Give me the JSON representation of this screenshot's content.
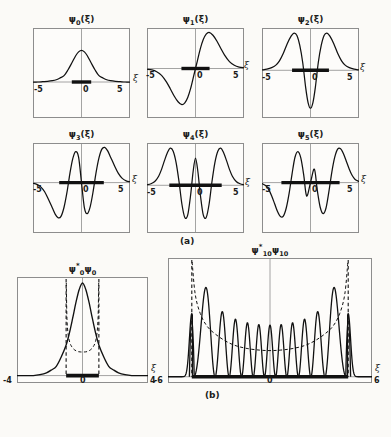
{
  "figure": {
    "background": "#fbfaf7",
    "ink": "#111111",
    "frame_color": "#8d8d8d",
    "section_a_label": "(a)",
    "section_b_label": "(b)",
    "axis_symbol": "ξ"
  },
  "chart_data": {
    "type": "line",
    "xlabel": "ξ",
    "ylabel": "",
    "grid": false,
    "legend": "none",
    "panels": [
      {
        "id": "psi0",
        "title_psi": "ψ",
        "title_sub": "0",
        "title_arg": "(ξ)",
        "title_full": "ψ0(ξ)",
        "section": "a",
        "xlim": [
          -5,
          5
        ],
        "xticks": [
          -5,
          0,
          5
        ],
        "xticklabels": [
          "-5",
          "0",
          "5"
        ],
        "nodes": 0,
        "parity": "even",
        "turning_bar": [
          -1.0,
          1.0
        ],
        "zero_line_frac": 0.6,
        "x": [
          -5,
          -4.5,
          -4,
          -3.5,
          -3,
          -2.6,
          -2.2,
          -1.8,
          -1.4,
          -1,
          -0.6,
          -0.3,
          0,
          0.3,
          0.6,
          1,
          1.4,
          1.8,
          2.2,
          2.6,
          3,
          3.5,
          4,
          4.5,
          5
        ],
        "y": [
          0.0,
          0.0,
          0.01,
          0.02,
          0.04,
          0.07,
          0.13,
          0.2,
          0.38,
          0.6,
          0.83,
          0.95,
          1.0,
          0.95,
          0.83,
          0.6,
          0.38,
          0.2,
          0.13,
          0.07,
          0.04,
          0.02,
          0.01,
          0.0,
          0.0
        ]
      },
      {
        "id": "psi1",
        "title_psi": "ψ",
        "title_sub": "1",
        "title_arg": "(ξ)",
        "title_full": "ψ1(ξ)",
        "section": "a",
        "xlim": [
          -5,
          5
        ],
        "xticks": [
          -5,
          0,
          5
        ],
        "xticklabels": [
          "-5",
          "0",
          "5"
        ],
        "nodes": 1,
        "parity": "odd",
        "turning_bar": [
          -1.45,
          1.45
        ],
        "zero_line_frac": 0.45,
        "x": [
          -5,
          -4.5,
          -4,
          -3.5,
          -3,
          -2.6,
          -2.2,
          -1.8,
          -1.4,
          -1.1,
          -0.8,
          -0.5,
          -0.2,
          0,
          0.2,
          0.5,
          0.8,
          1.1,
          1.4,
          1.8,
          2.2,
          2.6,
          3,
          3.5,
          4,
          4.5,
          5
        ],
        "y": [
          -0.02,
          -0.04,
          -0.09,
          -0.19,
          -0.37,
          -0.56,
          -0.76,
          -0.92,
          -1.0,
          -0.95,
          -0.8,
          -0.55,
          -0.22,
          0.0,
          0.22,
          0.55,
          0.8,
          0.95,
          1.0,
          0.92,
          0.76,
          0.56,
          0.37,
          0.19,
          0.09,
          0.04,
          0.02
        ]
      },
      {
        "id": "psi2",
        "title_psi": "ψ",
        "title_sub": "2",
        "title_arg": "(ξ)",
        "title_full": "ψ2(ξ)",
        "section": "a",
        "xlim": [
          -5,
          5
        ],
        "xticks": [
          -5,
          0,
          5
        ],
        "xticklabels": [
          "-5",
          "0",
          "5"
        ],
        "nodes": 2,
        "parity": "even",
        "turning_bar": [
          -1.9,
          1.9
        ],
        "zero_line_frac": 0.47,
        "x": [
          -5,
          -4.5,
          -4,
          -3.6,
          -3.2,
          -2.8,
          -2.4,
          -2.0,
          -1.7,
          -1.4,
          -1.1,
          -0.8,
          -0.5,
          -0.25,
          0,
          0.25,
          0.5,
          0.8,
          1.1,
          1.4,
          1.7,
          2.0,
          2.4,
          2.8,
          3.2,
          3.6,
          4,
          4.5,
          5
        ],
        "y": [
          0.01,
          0.03,
          0.07,
          0.13,
          0.25,
          0.45,
          0.7,
          0.9,
          0.98,
          0.92,
          0.65,
          0.2,
          -0.45,
          -0.85,
          -1.0,
          -0.85,
          -0.45,
          0.2,
          0.65,
          0.92,
          0.98,
          0.9,
          0.7,
          0.45,
          0.25,
          0.13,
          0.07,
          0.03,
          0.01
        ]
      },
      {
        "id": "psi3",
        "title_psi": "ψ",
        "title_sub": "3",
        "title_arg": "(ξ)",
        "title_full": "ψ3(ξ)",
        "section": "a",
        "xlim": [
          -5,
          5
        ],
        "xticks": [
          -5,
          0,
          5
        ],
        "xticklabels": [
          "-5",
          "0",
          "5"
        ],
        "nodes": 3,
        "parity": "odd",
        "turning_bar": [
          -2.3,
          2.3
        ],
        "zero_line_frac": 0.44,
        "x": [
          -5,
          -4.6,
          -4.2,
          -3.8,
          -3.4,
          -3.0,
          -2.7,
          -2.4,
          -2.1,
          -1.8,
          -1.5,
          -1.2,
          -0.9,
          -0.6,
          -0.3,
          0,
          0.3,
          0.6,
          0.9,
          1.2,
          1.5,
          1.8,
          2.1,
          2.4,
          2.7,
          3.0,
          3.4,
          3.8,
          4.2,
          4.6,
          5
        ],
        "y": [
          -0.02,
          -0.05,
          -0.12,
          -0.26,
          -0.48,
          -0.72,
          -0.9,
          -1.0,
          -0.95,
          -0.7,
          -0.28,
          0.25,
          0.68,
          0.88,
          0.72,
          0.0,
          -0.72,
          -0.88,
          -0.68,
          -0.25,
          0.28,
          0.7,
          0.95,
          1.0,
          0.9,
          0.72,
          0.48,
          0.26,
          0.12,
          0.05,
          0.02
        ]
      },
      {
        "id": "psi4",
        "title_psi": "ψ",
        "title_sub": "4",
        "title_arg": "(ξ)",
        "title_full": "ψ4(ξ)",
        "section": "a",
        "xlim": [
          -5,
          5
        ],
        "xticks": [
          -5,
          0,
          5
        ],
        "xticklabels": [
          "-5",
          "0",
          "5"
        ],
        "nodes": 4,
        "parity": "even",
        "turning_bar": [
          -2.7,
          2.7
        ],
        "zero_line_frac": 0.47,
        "x": [
          -5,
          -4.6,
          -4.2,
          -3.8,
          -3.5,
          -3.2,
          -2.9,
          -2.6,
          -2.3,
          -2.0,
          -1.7,
          -1.4,
          -1.1,
          -0.8,
          -0.5,
          -0.25,
          0,
          0.25,
          0.5,
          0.8,
          1.1,
          1.4,
          1.7,
          2.0,
          2.3,
          2.6,
          2.9,
          3.2,
          3.5,
          3.8,
          4.2,
          4.6,
          5
        ],
        "y": [
          0.01,
          0.04,
          0.1,
          0.24,
          0.42,
          0.65,
          0.86,
          0.98,
          0.9,
          0.6,
          0.1,
          -0.5,
          -0.85,
          -0.78,
          -0.25,
          0.35,
          0.72,
          0.35,
          -0.25,
          -0.78,
          -0.85,
          -0.5,
          0.1,
          0.6,
          0.9,
          0.98,
          0.86,
          0.65,
          0.42,
          0.24,
          0.1,
          0.04,
          0.01
        ]
      },
      {
        "id": "psi5",
        "title_psi": "ψ",
        "title_sub": "5",
        "title_arg": "(ξ)",
        "title_full": "ψ5(ξ)",
        "section": "a",
        "xlim": [
          -5,
          5
        ],
        "xticks": [
          -5,
          0,
          5
        ],
        "xticklabels": [
          "-5",
          "0",
          "5"
        ],
        "nodes": 5,
        "parity": "odd",
        "turning_bar": [
          -3.0,
          3.0
        ],
        "zero_line_frac": 0.44,
        "x": [
          -5,
          -4.6,
          -4.3,
          -4.0,
          -3.7,
          -3.4,
          -3.1,
          -2.8,
          -2.5,
          -2.2,
          -1.9,
          -1.6,
          -1.3,
          -1.0,
          -0.7,
          -0.4,
          0,
          0.4,
          0.7,
          1.0,
          1.3,
          1.6,
          1.9,
          2.2,
          2.5,
          2.8,
          3.1,
          3.4,
          3.7,
          4.0,
          4.3,
          4.6,
          5
        ],
        "y": [
          -0.03,
          -0.09,
          -0.2,
          -0.38,
          -0.6,
          -0.82,
          -0.96,
          -0.95,
          -0.72,
          -0.3,
          0.25,
          0.72,
          0.88,
          0.7,
          0.22,
          -0.38,
          0.0,
          0.38,
          -0.22,
          -0.7,
          -0.88,
          -0.72,
          -0.25,
          0.3,
          0.72,
          0.95,
          0.96,
          0.82,
          0.6,
          0.38,
          0.2,
          0.09,
          0.03
        ]
      },
      {
        "id": "prob0",
        "title_psi": "ψ",
        "title_sub": "0",
        "title_sup": "*",
        "title_second": "ψ",
        "title_second_sub": "0",
        "title_full": "ψ0*ψ0",
        "section": "b",
        "xlim": [
          -4,
          4
        ],
        "xticks": [
          -4,
          0,
          4
        ],
        "xticklabels": [
          "-4",
          "0",
          "4"
        ],
        "turning_bar": [
          -1.0,
          1.0
        ],
        "turning_lines": [
          -1.0,
          1.0
        ],
        "zero_line_frac": 0.93,
        "x": [
          -4,
          -3.5,
          -3,
          -2.6,
          -2.2,
          -1.9,
          -1.6,
          -1.3,
          -1.0,
          -0.8,
          -0.6,
          -0.4,
          -0.2,
          0,
          0.2,
          0.4,
          0.6,
          0.8,
          1.0,
          1.3,
          1.6,
          1.9,
          2.2,
          2.6,
          3,
          3.5,
          4
        ],
        "y": [
          0.0,
          0.0,
          0.0,
          0.01,
          0.03,
          0.06,
          0.1,
          0.2,
          0.33,
          0.46,
          0.62,
          0.79,
          0.93,
          1.0,
          0.93,
          0.79,
          0.62,
          0.46,
          0.33,
          0.2,
          0.1,
          0.06,
          0.03,
          0.01,
          0.0,
          0.0,
          0.0
        ],
        "classical_x": [
          -0.99,
          -0.95,
          -0.88,
          -0.78,
          -0.65,
          -0.5,
          -0.3,
          -0.1,
          0.1,
          0.3,
          0.5,
          0.65,
          0.78,
          0.88,
          0.95,
          0.99
        ],
        "classical_y": [
          1.0,
          0.62,
          0.45,
          0.36,
          0.31,
          0.28,
          0.26,
          0.255,
          0.255,
          0.26,
          0.28,
          0.31,
          0.36,
          0.45,
          0.62,
          1.0
        ]
      },
      {
        "id": "prob10",
        "title_psi": "ψ",
        "title_sub": "10",
        "title_sup": "*",
        "title_second": "ψ",
        "title_second_sub": "10",
        "title_full": "ψ10*ψ10",
        "section": "b",
        "xlim": [
          -6,
          6
        ],
        "xticks": [
          -6,
          0,
          6
        ],
        "xticklabels": [
          "-6",
          "0",
          "6"
        ],
        "turning_bar": [
          -4.6,
          4.6
        ],
        "turning_lines": [
          -4.6,
          4.6
        ],
        "zero_line_frac": 0.95,
        "peak_count": 11,
        "peak_positions": [
          -4.55,
          -3.75,
          -3.05,
          -2.4,
          -1.75,
          -1.15,
          -0.55,
          0.0,
          0.55,
          1.15,
          1.75,
          2.4,
          3.05,
          3.75,
          4.55
        ],
        "classical_x": [
          -4.58,
          -4.4,
          -4.1,
          -3.7,
          -3.2,
          -2.6,
          -2,
          -1.3,
          -0.6,
          0,
          0.6,
          1.3,
          2,
          2.6,
          3.2,
          3.7,
          4.1,
          4.4,
          4.58
        ],
        "classical_y": [
          1.0,
          0.72,
          0.55,
          0.44,
          0.37,
          0.31,
          0.27,
          0.245,
          0.232,
          0.228,
          0.232,
          0.245,
          0.27,
          0.31,
          0.37,
          0.44,
          0.55,
          0.72,
          1.0
        ]
      }
    ]
  }
}
